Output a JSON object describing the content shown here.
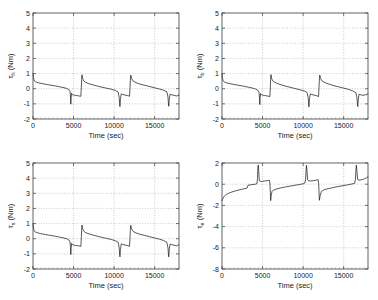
{
  "figure": {
    "background": "#ffffff",
    "line_color": "#111111",
    "grid_color": "#9a9a9a",
    "axis_color": "#3c3c3c",
    "panel_count": 4
  },
  "chart_data": [
    {
      "type": "line",
      "panel": "top-left",
      "title": "",
      "xlabel": "Time (sec)",
      "ylabel": "τ",
      "ylabel_sub": "h",
      "ylabel_units": " (Nm)",
      "xlim": [
        0,
        18000
      ],
      "ylim": [
        -2,
        5
      ],
      "xticks": [
        0,
        5000,
        10000,
        15000
      ],
      "xticklabels": [
        "0",
        "5000",
        "10000",
        "15000"
      ],
      "yticks": [
        -2,
        -1,
        0,
        1,
        2,
        3,
        4,
        5
      ],
      "yticklabels": [
        "-2",
        "-1",
        "0",
        "1",
        "2",
        "3",
        "4",
        "5"
      ],
      "grid": true,
      "legend": "none",
      "series": [
        {
          "name": "tau_h",
          "x": [
            0,
            60,
            120,
            200,
            320,
            500,
            760,
            1100,
            1500,
            1900,
            2350,
            2800,
            3250,
            3700,
            4150,
            4400,
            4560,
            4620,
            4660,
            4700,
            4760,
            4860,
            5000,
            5250,
            5600,
            5900,
            5960,
            6000,
            6040,
            6100,
            6250,
            6500,
            6900,
            7400,
            7900,
            8500,
            9100,
            9700,
            10200,
            10500,
            10620,
            10680,
            10720,
            10780,
            10880,
            11050,
            11350,
            11700,
            11900,
            11960,
            12000,
            12050,
            12150,
            12350,
            12700,
            13200,
            13800,
            14400,
            15000,
            15600,
            16100,
            16500,
            16640,
            16700,
            16740,
            16800,
            16900,
            17100,
            17400,
            17700,
            18000
          ],
          "y": [
            1.0,
            0.72,
            0.58,
            0.5,
            0.46,
            0.42,
            0.38,
            0.34,
            0.3,
            0.26,
            0.22,
            0.18,
            0.13,
            0.08,
            0.02,
            -0.05,
            -0.18,
            -0.55,
            -1.02,
            -0.62,
            -0.3,
            -0.4,
            -0.42,
            -0.44,
            -0.47,
            -0.5,
            0.1,
            0.6,
            0.92,
            0.7,
            0.52,
            0.42,
            0.33,
            0.25,
            0.18,
            0.1,
            0.03,
            -0.04,
            -0.12,
            -0.22,
            -0.55,
            -0.98,
            -1.18,
            -0.7,
            -0.34,
            -0.38,
            -0.42,
            -0.46,
            -0.5,
            0.05,
            0.55,
            0.9,
            0.68,
            0.5,
            0.4,
            0.3,
            0.22,
            0.14,
            0.06,
            -0.02,
            -0.1,
            -0.2,
            -0.55,
            -1.0,
            -1.16,
            -0.7,
            -0.36,
            -0.4,
            -0.44,
            -0.48,
            -0.42
          ]
        }
      ]
    },
    {
      "type": "line",
      "panel": "top-right",
      "title": "",
      "xlabel": "Time (sec)",
      "ylabel": "τ",
      "ylabel_sub": "b",
      "ylabel_units": " (Nm)",
      "xlim": [
        0,
        18000
      ],
      "ylim": [
        -2,
        5
      ],
      "xticks": [
        0,
        5000,
        10000,
        15000
      ],
      "xticklabels": [
        "0",
        "5000",
        "10000",
        "15000"
      ],
      "yticks": [
        -2,
        -1,
        0,
        1,
        2,
        3,
        4,
        5
      ],
      "yticklabels": [
        "-2",
        "-1",
        "0",
        "1",
        "2",
        "3",
        "4",
        "5"
      ],
      "grid": true,
      "legend": "none",
      "series": [
        {
          "name": "tau_b",
          "x": [
            0,
            60,
            120,
            200,
            320,
            500,
            760,
            1100,
            1500,
            1900,
            2350,
            2800,
            3250,
            3700,
            4150,
            4400,
            4560,
            4620,
            4660,
            4700,
            4760,
            4860,
            5000,
            5250,
            5600,
            5900,
            5960,
            6000,
            6040,
            6100,
            6250,
            6500,
            6900,
            7400,
            7900,
            8500,
            9100,
            9700,
            10200,
            10500,
            10620,
            10680,
            10720,
            10780,
            10880,
            11050,
            11350,
            11700,
            11900,
            11960,
            12000,
            12050,
            12150,
            12350,
            12700,
            13200,
            13800,
            14400,
            15000,
            15600,
            16100,
            16500,
            16640,
            16700,
            16740,
            16800,
            16900,
            17100,
            17400,
            17700,
            18000
          ],
          "y": [
            1.0,
            0.7,
            0.56,
            0.48,
            0.44,
            0.4,
            0.36,
            0.32,
            0.28,
            0.24,
            0.2,
            0.15,
            0.1,
            0.05,
            -0.02,
            -0.1,
            -0.22,
            -0.6,
            -1.05,
            -0.65,
            -0.32,
            -0.4,
            -0.42,
            -0.45,
            -0.48,
            -0.52,
            0.12,
            0.62,
            0.93,
            0.7,
            0.52,
            0.42,
            0.33,
            0.24,
            0.16,
            0.08,
            0.0,
            -0.08,
            -0.16,
            -0.26,
            -0.58,
            -1.0,
            -1.2,
            -0.72,
            -0.34,
            -0.38,
            -0.42,
            -0.47,
            -0.52,
            0.06,
            0.56,
            0.9,
            0.68,
            0.5,
            0.4,
            0.3,
            0.2,
            0.12,
            0.04,
            -0.04,
            -0.14,
            -0.26,
            -0.6,
            -1.02,
            -1.18,
            -0.7,
            -0.36,
            -0.4,
            -0.44,
            -0.4,
            -0.34
          ]
        }
      ]
    },
    {
      "type": "line",
      "panel": "bottom-left",
      "title": "",
      "xlabel": "Time (sec)",
      "ylabel": "τ",
      "ylabel_sub": "s",
      "ylabel_units": " (Nm)",
      "xlim": [
        0,
        18000
      ],
      "ylim": [
        -2,
        5
      ],
      "xticks": [
        0,
        5000,
        10000,
        15000
      ],
      "xticklabels": [
        "0",
        "5000",
        "10000",
        "15000"
      ],
      "yticks": [
        -2,
        -1,
        0,
        1,
        2,
        3,
        4,
        5
      ],
      "yticklabels": [
        "-2",
        "-1",
        "0",
        "1",
        "2",
        "3",
        "4",
        "5"
      ],
      "grid": true,
      "legend": "none",
      "series": [
        {
          "name": "tau_s",
          "x": [
            0,
            60,
            120,
            200,
            320,
            500,
            760,
            1100,
            1500,
            1900,
            2350,
            2800,
            3250,
            3700,
            4150,
            4400,
            4560,
            4620,
            4660,
            4700,
            4760,
            4860,
            5000,
            5250,
            5600,
            5900,
            5960,
            6000,
            6040,
            6100,
            6250,
            6500,
            6900,
            7400,
            7900,
            8500,
            9100,
            9700,
            10200,
            10500,
            10620,
            10680,
            10720,
            10780,
            10880,
            11050,
            11350,
            11700,
            11900,
            11960,
            12000,
            12050,
            12150,
            12350,
            12700,
            13200,
            13800,
            14400,
            15000,
            15600,
            16100,
            16500,
            16640,
            16700,
            16740,
            16800,
            16900,
            17100,
            17400,
            17700,
            18000
          ],
          "y": [
            1.0,
            0.7,
            0.56,
            0.48,
            0.44,
            0.4,
            0.36,
            0.32,
            0.28,
            0.24,
            0.2,
            0.16,
            0.11,
            0.06,
            0.0,
            -0.07,
            -0.2,
            -0.58,
            -1.05,
            -0.64,
            -0.3,
            -0.38,
            -0.42,
            -0.44,
            -0.47,
            -0.5,
            0.1,
            0.6,
            0.9,
            0.68,
            0.5,
            0.4,
            0.32,
            0.24,
            0.17,
            0.09,
            0.02,
            -0.06,
            -0.14,
            -0.24,
            -0.56,
            -1.02,
            -1.2,
            -0.72,
            -0.34,
            -0.38,
            -0.42,
            -0.46,
            -0.5,
            0.06,
            0.56,
            0.88,
            0.66,
            0.48,
            0.38,
            0.29,
            0.21,
            0.13,
            0.05,
            -0.03,
            -0.12,
            -0.24,
            -0.6,
            -1.05,
            -1.2,
            -0.7,
            -0.35,
            -0.39,
            -0.43,
            -0.47,
            -0.4
          ]
        }
      ]
    },
    {
      "type": "line",
      "panel": "bottom-right",
      "title": "",
      "xlabel": "Time (sec)",
      "ylabel": "τ",
      "ylabel_sub": "e",
      "ylabel_units": " (Nm)",
      "xlim": [
        0,
        18000
      ],
      "ylim": [
        -8,
        2
      ],
      "xticks": [
        0,
        5000,
        10000,
        15000
      ],
      "xticklabels": [
        "0",
        "5000",
        "10000",
        "15000"
      ],
      "yticks": [
        -8,
        -6,
        -4,
        -2,
        0,
        2
      ],
      "yticklabels": [
        "-8",
        "-6",
        "-4",
        "-2",
        "0",
        "2"
      ],
      "grid": true,
      "legend": "none",
      "series": [
        {
          "name": "tau_e",
          "x": [
            0,
            60,
            150,
            300,
            500,
            800,
            1200,
            1700,
            2200,
            2700,
            3100,
            3200,
            3600,
            4100,
            4300,
            4380,
            4420,
            4470,
            4520,
            4600,
            4700,
            4900,
            5200,
            5600,
            5850,
            5920,
            5960,
            6000,
            6060,
            6160,
            6350,
            6700,
            7200,
            7800,
            8400,
            9000,
            9600,
            10000,
            10200,
            10300,
            10360,
            10410,
            10470,
            10560,
            10700,
            10950,
            11300,
            11700,
            11860,
            11920,
            11960,
            12010,
            12100,
            12260,
            12600,
            13100,
            13700,
            14300,
            14900,
            15500,
            16000,
            16350,
            16450,
            16510,
            16560,
            16620,
            16720,
            16900,
            17200,
            17550,
            17850,
            18000
          ],
          "y": [
            -1.55,
            -1.45,
            -1.28,
            -1.12,
            -0.98,
            -0.86,
            -0.74,
            -0.62,
            -0.52,
            -0.44,
            -0.36,
            -0.1,
            -0.05,
            0.0,
            0.05,
            0.55,
            1.45,
            1.8,
            1.3,
            0.35,
            0.28,
            0.26,
            0.3,
            0.34,
            0.36,
            0.0,
            -0.8,
            -1.55,
            -1.1,
            -0.7,
            -0.55,
            -0.46,
            -0.36,
            -0.26,
            -0.18,
            -0.1,
            -0.02,
            0.04,
            0.1,
            0.4,
            1.2,
            1.78,
            1.35,
            0.4,
            0.32,
            0.3,
            0.34,
            0.4,
            0.42,
            0.05,
            -0.75,
            -1.52,
            -1.08,
            -0.68,
            -0.52,
            -0.42,
            -0.32,
            -0.22,
            -0.14,
            -0.06,
            0.02,
            0.08,
            0.45,
            1.25,
            1.8,
            1.35,
            0.45,
            0.38,
            0.42,
            0.5,
            0.62,
            0.7
          ]
        }
      ]
    }
  ]
}
